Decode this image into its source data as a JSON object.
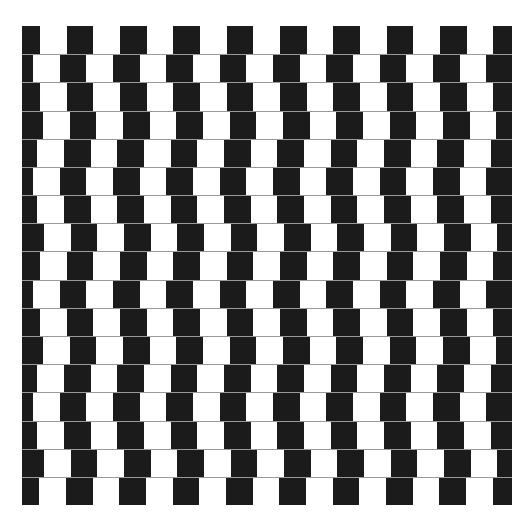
{
  "illusion": {
    "name": "Café wall illusion",
    "rows": 17,
    "tile_width": 26.67,
    "period": 53.33,
    "row_height": 28.18,
    "base_start": -8.67,
    "row_offsets": [
      0,
      -7,
      0,
      3,
      -2.7,
      -7,
      -2.7,
      4,
      0,
      -7,
      0,
      3,
      -2.7,
      -7,
      -2.7,
      4,
      -0.7
    ],
    "colors": {
      "background": "#ffffff",
      "tile": "#1b1b1b",
      "mortar": "#9a9a9a"
    }
  }
}
